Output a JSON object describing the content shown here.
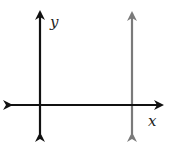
{
  "diagram": {
    "type": "coordinate-plane-vertical-line",
    "axes": {
      "x_label": "x",
      "y_label": "y",
      "axis_color": "#111111"
    },
    "vertical_line": {
      "description": "vertical line to the right of the y-axis",
      "color": "#7a7a7a"
    }
  }
}
